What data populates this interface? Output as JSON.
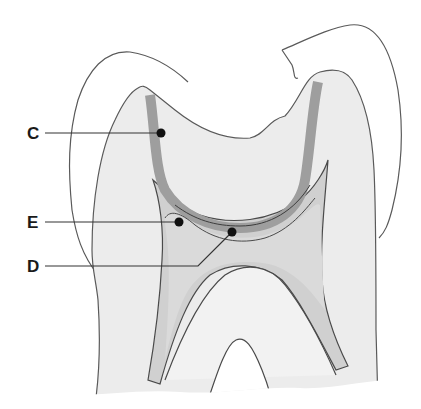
{
  "figure": {
    "colors": {
      "background": "#ffffff",
      "outline": "#5a5a5a",
      "tooth_body": "#ececec",
      "band_C": "#9e9e9e",
      "region_E": "#c8c8c8",
      "region_D": "#d6d6d6",
      "leader": "#333333",
      "dot": "#111111"
    }
  },
  "labels": [
    {
      "id": "C",
      "text": "C",
      "x": 33,
      "y": 133,
      "target_x": 161,
      "target_y": 133
    },
    {
      "id": "E",
      "text": "E",
      "x": 33,
      "y": 222,
      "target_x": 179,
      "target_y": 222
    },
    {
      "id": "D",
      "text": "D",
      "x": 33,
      "y": 266,
      "target_x": 232,
      "target_y": 232
    }
  ]
}
